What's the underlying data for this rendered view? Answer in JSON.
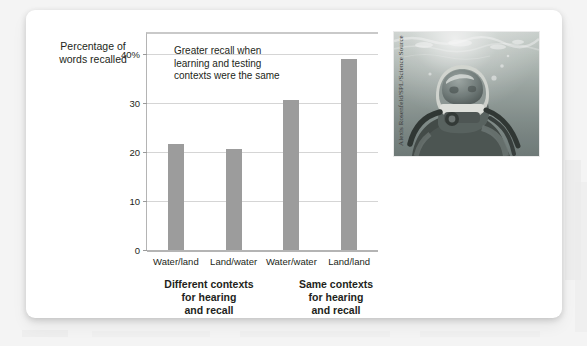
{
  "figure": {
    "photo_credit": "Alexis Rosenfeld/SPL/Science Source",
    "photo_alt": "scuba-diver-underwater"
  },
  "chart_data": {
    "type": "bar",
    "title": "",
    "xlabel": "",
    "ylabel": "Percentage of words recalled",
    "ylabel_line1": "Percentage of",
    "ylabel_line2": "words recalled",
    "categories": [
      "Water/land",
      "Land/water",
      "Water/water",
      "Land/land"
    ],
    "values": [
      21.5,
      20.5,
      30.5,
      39
    ],
    "ylim": [
      0,
      44
    ],
    "yticks": [
      0,
      10,
      20,
      30,
      40
    ],
    "ytick_labels": [
      "0",
      "10",
      "20",
      "30",
      "40%"
    ],
    "grid": true,
    "legend": "none",
    "bar_color": "#9c9c9c",
    "annotation": {
      "line1": "Greater recall when",
      "line2": "learning and testing",
      "line3": "contexts were the same"
    },
    "group_captions": [
      {
        "line1": "Different contexts",
        "line2": "for hearing",
        "line3": "and recall"
      },
      {
        "line1": "Same contexts",
        "line2": "for hearing",
        "line3": "and recall"
      }
    ]
  }
}
